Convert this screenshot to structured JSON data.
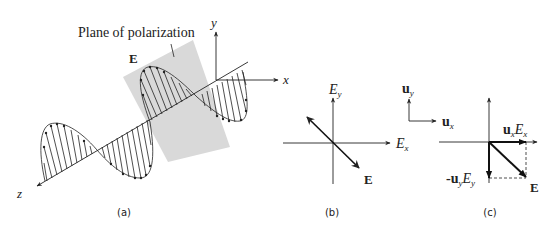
{
  "figure": {
    "panels": [
      {
        "id": "a",
        "caption": "(a)",
        "plane_label": "Plane of polarization",
        "field_label": "E",
        "axis_labels": {
          "x": "x",
          "y": "y",
          "z": "z"
        }
      },
      {
        "id": "b",
        "caption": "(b)",
        "axis_labels": {
          "horizontal": "E",
          "horizontal_sub": "x",
          "vertical": "E",
          "vertical_sub": "y"
        },
        "vector_label": "E"
      },
      {
        "id": "c",
        "caption": "(c)",
        "unit_vectors": {
          "uy": "u",
          "uy_sub": "y",
          "ux": "u",
          "ux_sub": "x"
        },
        "component_x_label": {
          "u": "u",
          "u_sub": "x",
          "E": "E",
          "E_sub": "x"
        },
        "component_y_label": {
          "prefix": "-",
          "u": "u",
          "u_sub": "y",
          "E": "E",
          "E_sub": "y"
        },
        "vector_label": "E"
      }
    ],
    "colors": {
      "stroke": "#222222",
      "plane_fill": "#d9d9d9",
      "background": "#ffffff"
    }
  }
}
